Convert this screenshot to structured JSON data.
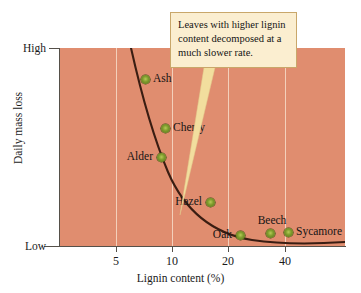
{
  "chart_data": {
    "type": "scatter",
    "title": "",
    "xlabel": "Lignin content (%)",
    "ylabel": "Daily mass loss",
    "x_scale": "log",
    "x_ticks": [
      "5",
      "10",
      "20",
      "40"
    ],
    "x_tick_values": [
      5,
      10,
      20,
      40
    ],
    "y_ticks": [
      "High",
      "Low"
    ],
    "y_tick_values": [
      "High",
      "Low"
    ],
    "grid": "vertical",
    "legend": "none",
    "background_color": "#e08d6f",
    "marker_color": "#7d9b2c",
    "curve_color": "#3a1d12",
    "points": [
      {
        "label": "Ash",
        "x": 7.2,
        "y_desc": "high",
        "x_px": 145,
        "y_px": 79,
        "label_pos": "right"
      },
      {
        "label": "Cherry",
        "x": 9.6,
        "y_desc": "moderate-high",
        "x_px": 165,
        "y_px": 128,
        "label_pos": "right"
      },
      {
        "label": "Alder",
        "x": 9.0,
        "y_desc": "moderate",
        "x_px": 161,
        "y_px": 157,
        "label_pos": "left"
      },
      {
        "label": "Hazel",
        "x": 16.5,
        "y_desc": "low-moderate",
        "x_px": 210,
        "y_px": 202,
        "label_pos": "left"
      },
      {
        "label": "Oak",
        "x": 24.0,
        "y_desc": "low",
        "x_px": 240,
        "y_px": 235,
        "label_pos": "left"
      },
      {
        "label": "Beech",
        "x": 34.0,
        "y_desc": "low",
        "x_px": 270,
        "y_px": 233,
        "label_pos": "above"
      },
      {
        "label": "Sycamore",
        "x": 41.0,
        "y_desc": "low",
        "x_px": 288,
        "y_px": 232,
        "label_pos": "right"
      }
    ],
    "trend_curve": {
      "description": "Smooth decreasing curve showing daily mass loss declining steeply as lignin content increases, then flattening.",
      "path": "M 71 0 C 80 40, 92 86, 108 124 C 126 166, 155 186, 192 192 C 225 197, 255 196, 285 194"
    },
    "annotation": {
      "text": "Leaves with higher lignin content decomposed at a much slower rate.",
      "pointer_color": "#f2de9e",
      "box_fill": "#fbeed0",
      "box_border": "#c9a76a"
    }
  }
}
